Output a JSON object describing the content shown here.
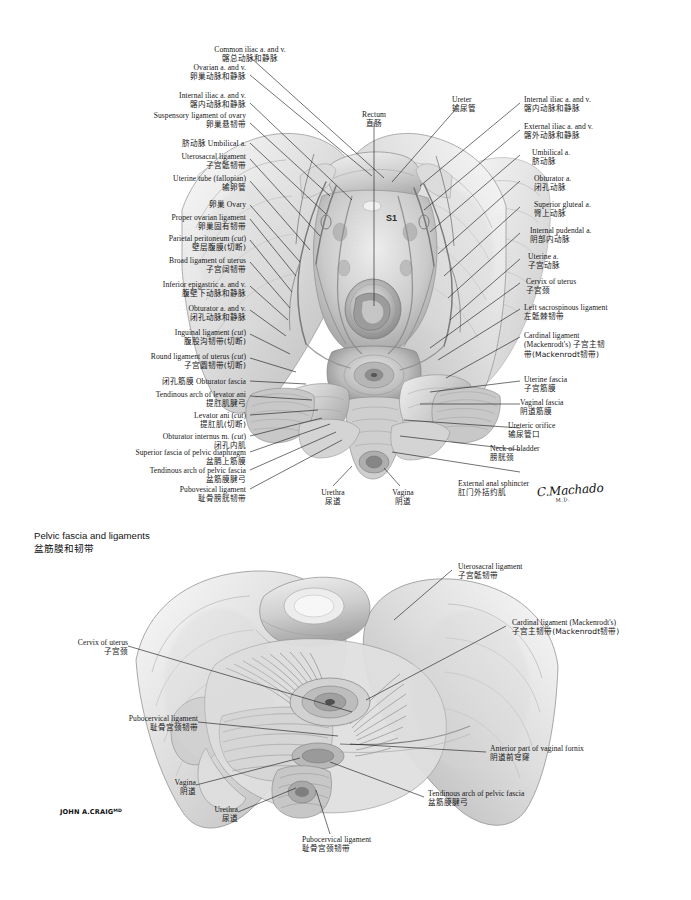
{
  "plate": {
    "background": "#ffffff",
    "ink": "#161616"
  },
  "figures": [
    {
      "id": "figure-1",
      "caption_en": "",
      "caption_zh": "",
      "vertebra_marker": "S1",
      "signature": {
        "name": "C.Machado",
        "suffix": "M.D."
      }
    },
    {
      "id": "figure-2",
      "caption_en": "Pelvic fascia and ligaments",
      "caption_zh": "盆筋膜和韧带",
      "signature": {
        "name": "JOHN A.CRAIG",
        "suffix": "MD"
      }
    }
  ],
  "figure1_labels": {
    "common_iliac": {
      "en": "Common iliac a. and v.",
      "zh": "髂总动脉和静脉"
    },
    "ovarian": {
      "en": "Ovarian a. and v.",
      "zh": "卵巢动脉和静脉"
    },
    "internal_iliac_left": {
      "en": "Internal iliac a. and v.",
      "zh": "髂内动脉和静脉"
    },
    "suspensory_ligament_ovary": {
      "en": "Suspensory ligament of ovary",
      "zh": "卵巢悬韧带"
    },
    "umbilical_a_left": {
      "en": "脐动脉 Umbilical a.",
      "zh": ""
    },
    "uterosacral_ligament": {
      "en": "Uterosacral ligament",
      "zh": "子宫骶韧带"
    },
    "uterine_tube": {
      "en": "Uterine tube (fallopian)",
      "zh": "输卵管"
    },
    "ovary": {
      "en": "卵巢 Ovary",
      "zh": ""
    },
    "proper_ovarian_ligament": {
      "en": "Proper ovarian ligament",
      "zh": "卵巢固有韧带"
    },
    "parietal_peritoneum": {
      "en": "Parietal peritoneum (cut)",
      "zh": "壁层腹膜(切断)",
      "italic": "cut"
    },
    "broad_ligament": {
      "en": "Broad ligament of uterus",
      "zh": "子宫阔韧带"
    },
    "inferior_epigastric": {
      "en": "Inferior epigastric a. and v.",
      "zh": "腹壁下动脉和静脉"
    },
    "obturator_av": {
      "en": "Obturator a. and v.",
      "zh": "闭孔动脉和静脉"
    },
    "inguinal_ligament": {
      "en": "Inguinal ligament (cut)",
      "zh": "腹股沟韧带(切断)",
      "italic": "cut"
    },
    "round_ligament": {
      "en": "Round ligament of uterus (cut)",
      "zh": "子宫圆韧带(切断)",
      "italic": "cut"
    },
    "obturator_fascia": {
      "en": "闭孔筋膜 Obturator fascia",
      "zh": ""
    },
    "tendinous_arch_levator_ani": {
      "en": "Tendinous arch of levator ani",
      "zh": "提肛肌腱弓"
    },
    "levator_ani": {
      "en": "Levator ani (cut)",
      "zh": "提肛肌(切断)",
      "italic": "cut"
    },
    "obturator_internus": {
      "en": "Obturator internus m. (cut)",
      "zh": "闭孔内肌",
      "italic": "cut"
    },
    "superior_fascia_pelvic_diaphragm": {
      "en": "Superior fascia of pelvic diaphragm",
      "zh": "盆膈上筋膜"
    },
    "tendinous_arch_pelvic_fascia": {
      "en": "Tendinous arch of pelvic fascia",
      "zh": "盆筋膜腱弓"
    },
    "pubovesical_ligament": {
      "en": "Pubovesical ligament",
      "zh": "耻骨膀胱韧带"
    },
    "rectum": {
      "en": "Rectum",
      "zh": "直肠"
    },
    "ureter": {
      "en": "Ureter",
      "zh": "输尿管"
    },
    "internal_iliac_right": {
      "en": "Internal iliac a. and v.",
      "zh": "髂内动脉和静脉"
    },
    "external_iliac_right": {
      "en": "External iliac a. and v.",
      "zh": "髂外动脉和静脉"
    },
    "umbilical_a_right": {
      "en": "Umbilical a.",
      "zh": "脐动脉"
    },
    "obturator_a_right": {
      "en": "Obturator a.",
      "zh": "闭孔动脉"
    },
    "superior_gluteal": {
      "en": "Superior gluteal a.",
      "zh": "臀上动脉"
    },
    "internal_pudendal": {
      "en": "Internal pudendal a.",
      "zh": "阴部内动脉"
    },
    "uterine_a": {
      "en": "Uterine a.",
      "zh": "子宫动脉"
    },
    "cervix_of_uterus": {
      "en": "Cervix of uterus",
      "zh": "子宫颈"
    },
    "left_sacrospinous_ligament": {
      "en": "Left sacrospinous ligament",
      "zh": "左骶棘韧带"
    },
    "cardinal_ligament": {
      "en": "Cardinal ligament",
      "en2": "(Mackenrodt's) 子宫主韧",
      "zh": "带(Mackenrodt韧带)"
    },
    "uterine_fascia": {
      "en": "Uterine fascia",
      "zh": "子宫筋膜"
    },
    "vaginal_fascia": {
      "en": "Vaginal fascia",
      "zh": "阴道筋膜"
    },
    "ureteric_orifice": {
      "en": "Ureteric orifice",
      "zh": "输尿管口"
    },
    "neck_of_bladder": {
      "en": "Neck of bladder",
      "zh": "膀胱颈"
    },
    "external_anal_sphincter": {
      "en": "External anal sphincter",
      "zh": "肛门外括约肌"
    },
    "urethra": {
      "en": "Urethra",
      "zh": "尿道"
    },
    "vagina": {
      "en": "Vagina",
      "zh": "阴道"
    }
  },
  "figure2_labels": {
    "uterosacral_ligament": {
      "en": "Uterosacral ligament",
      "zh": "子宫骶韧带"
    },
    "cardinal_ligament": {
      "en": "Cardinal ligament (Mackenrodt's)",
      "zh": "子宫主韧带(Mackenrodt韧带)"
    },
    "cervix_of_uterus": {
      "en": "Cervix of uterus",
      "zh": "子宫颈"
    },
    "pubocervical_ligament_left": {
      "en": "Pubocervical ligament",
      "zh": "耻骨宫颈韧带"
    },
    "anterior_part_vaginal_fornix": {
      "en": "Anterior part of vaginal fornix",
      "zh": "阴道前穹窿"
    },
    "vagina": {
      "en": "Vagina",
      "zh": "阴道"
    },
    "tendinous_arch_pelvic_fascia": {
      "en": "Tendinous arch of pelvic fascia",
      "zh": "盆筋膜腱弓"
    },
    "urethra": {
      "en": "Urethra",
      "zh": "尿道"
    },
    "pubocervical_ligament_bottom": {
      "en": "Pubocervical ligament",
      "zh": "耻骨宫颈韧带"
    }
  }
}
